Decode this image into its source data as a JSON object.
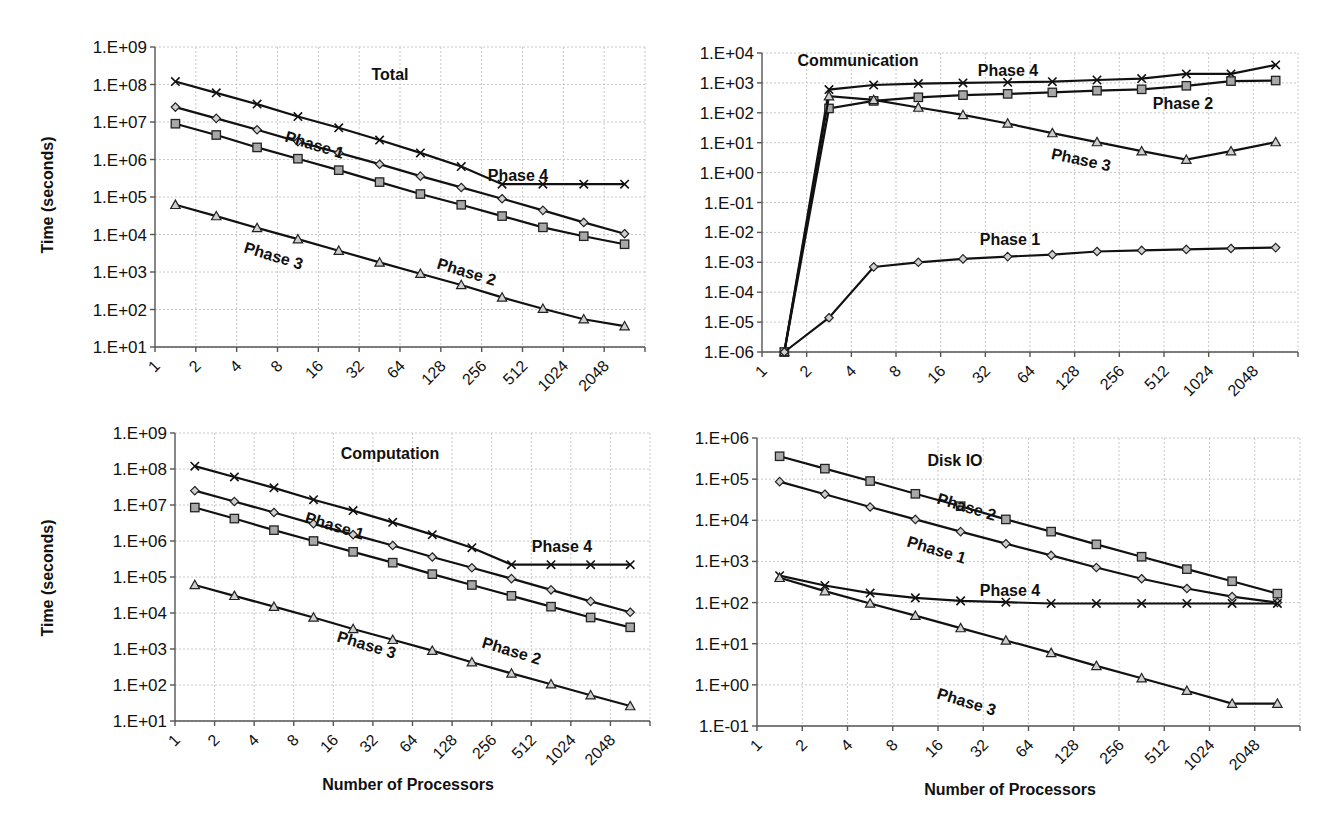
{
  "chart_data": [
    {
      "type": "line",
      "title": "Total",
      "xlabel": "",
      "ylabel": "Time (seconds)",
      "yscale": "log",
      "ylim": [
        10.0,
        1000000000.0
      ],
      "ytick_labels": [
        "1.E+01",
        "1.E+02",
        "1.E+03",
        "1.E+04",
        "1.E+05",
        "1.E+06",
        "1.E+07",
        "1.E+08",
        "1.E+09"
      ],
      "categories": [
        "1",
        "2",
        "4",
        "8",
        "16",
        "32",
        "64",
        "128",
        "256",
        "512",
        "1024",
        "2048"
      ],
      "grid": true,
      "legend": "inline labels",
      "series": [
        {
          "name": "Phase 4",
          "marker": "x",
          "values": [
            120000000.0,
            60000000.0,
            30000000.0,
            14000000.0,
            7000000.0,
            3300000.0,
            1500000.0,
            650000.0,
            220000.0,
            220000.0,
            220000.0,
            220000.0
          ]
        },
        {
          "name": "Phase 1",
          "marker": "diamond",
          "values": [
            25000000.0,
            12500000.0,
            6200000.0,
            3000000.0,
            1500000.0,
            750000.0,
            360000.0,
            180000.0,
            90000.0,
            44000.0,
            21000.0,
            10500.0
          ]
        },
        {
          "name": "Phase 2",
          "marker": "square",
          "values": [
            9000000.0,
            4500000.0,
            2100000.0,
            1050000.0,
            520000.0,
            250000.0,
            120000.0,
            62000.0,
            31000.0,
            15500.0,
            9000.0,
            5500.0
          ]
        },
        {
          "name": "Phase 3",
          "marker": "triangle",
          "values": [
            62000.0,
            31000.0,
            15000.0,
            7500.0,
            3700.0,
            1800.0,
            900.0,
            450.0,
            210.0,
            105.0,
            55.0,
            36.0
          ]
        }
      ]
    },
    {
      "type": "line",
      "title": "Communication",
      "xlabel": "",
      "ylabel": "",
      "yscale": "log",
      "ylim": [
        1e-06,
        10000.0
      ],
      "ytick_labels": [
        "1.E-06",
        "1.E-05",
        "1.E-04",
        "1.E-03",
        "1.E-02",
        "1.E-01",
        "1.E+00",
        "1.E+01",
        "1.E+02",
        "1.E+03",
        "1.E+04"
      ],
      "categories": [
        "1",
        "2",
        "4",
        "8",
        "16",
        "32",
        "64",
        "128",
        "256",
        "512",
        "1024",
        "2048"
      ],
      "grid": true,
      "legend": "inline labels",
      "series": [
        {
          "name": "Phase 4",
          "marker": "x",
          "values": [
            1e-06,
            600.0,
            850.0,
            950.0,
            1000.0,
            1050.0,
            1100.0,
            1250.0,
            1400.0,
            2000.0,
            2000.0,
            4000.0
          ]
        },
        {
          "name": "Phase 2",
          "marker": "square",
          "values": [
            1e-06,
            140.0,
            250.0,
            330.0,
            390.0,
            430.0,
            480.0,
            550.0,
            610.0,
            800.0,
            1150.0,
            1200.0
          ]
        },
        {
          "name": "Phase 3",
          "marker": "triangle",
          "values": [
            1e-06,
            360.0,
            270.0,
            150.0,
            85.0,
            44.0,
            21.0,
            10.5,
            5.2,
            2.7,
            5.2,
            10.5
          ]
        },
        {
          "name": "Phase 1",
          "marker": "diamond",
          "values": [
            1e-06,
            1.4e-05,
            0.0007,
            0.001,
            0.0013,
            0.00155,
            0.0018,
            0.0023,
            0.0025,
            0.0027,
            0.0029,
            0.0031
          ]
        }
      ]
    },
    {
      "type": "line",
      "title": "Computation",
      "xlabel": "Number of Processors",
      "ylabel": "Time (seconds)",
      "yscale": "log",
      "ylim": [
        10.0,
        1000000000.0
      ],
      "ytick_labels": [
        "1.E+01",
        "1.E+02",
        "1.E+03",
        "1.E+04",
        "1.E+05",
        "1.E+06",
        "1.E+07",
        "1.E+08",
        "1.E+09"
      ],
      "categories": [
        "1",
        "2",
        "4",
        "8",
        "16",
        "32",
        "64",
        "128",
        "256",
        "512",
        "1024",
        "2048"
      ],
      "grid": true,
      "legend": "inline labels",
      "series": [
        {
          "name": "Phase 4",
          "marker": "x",
          "values": [
            120000000.0,
            60000000.0,
            30000000.0,
            14000000.0,
            7000000.0,
            3300000.0,
            1500000.0,
            650000.0,
            220000.0,
            220000.0,
            220000.0,
            220000.0
          ]
        },
        {
          "name": "Phase 1",
          "marker": "diamond",
          "values": [
            25000000.0,
            12500000.0,
            6200000.0,
            3000000.0,
            1500000.0,
            750000.0,
            360000.0,
            180000.0,
            90000.0,
            44000.0,
            21000.0,
            10500.0
          ]
        },
        {
          "name": "Phase 2",
          "marker": "square",
          "values": [
            8500000.0,
            4200000.0,
            2000000.0,
            1000000.0,
            500000.0,
            250000.0,
            120000.0,
            60000.0,
            30000.0,
            15000.0,
            7500.0,
            4000.0
          ]
        },
        {
          "name": "Phase 3",
          "marker": "triangle",
          "values": [
            60000.0,
            30000.0,
            15000.0,
            7500.0,
            3600.0,
            1800.0,
            900.0,
            430.0,
            210.0,
            105.0,
            52.0,
            26.0
          ]
        }
      ]
    },
    {
      "type": "line",
      "title": "Disk IO",
      "xlabel": "Number of Processors",
      "ylabel": "",
      "yscale": "log",
      "ylim": [
        0.1,
        1000000.0
      ],
      "ytick_labels": [
        "1.E-01",
        "1.E+00",
        "1.E+01",
        "1.E+02",
        "1.E+03",
        "1.E+04",
        "1.E+05",
        "1.E+06"
      ],
      "categories": [
        "1",
        "2",
        "4",
        "8",
        "16",
        "32",
        "64",
        "128",
        "256",
        "512",
        "1024",
        "2048"
      ],
      "grid": true,
      "legend": "inline labels",
      "series": [
        {
          "name": "Phase 2",
          "marker": "square",
          "values": [
            360000.0,
            180000.0,
            90000.0,
            44000.0,
            22000.0,
            10500.0,
            5300.0,
            2600.0,
            1300.0,
            650.0,
            330.0,
            165.0
          ]
        },
        {
          "name": "Phase 1",
          "marker": "diamond",
          "values": [
            87000.0,
            43000.0,
            21000.0,
            10500.0,
            5300.0,
            2700.0,
            1400.0,
            710.0,
            380.0,
            220.0,
            140.0,
            100.0
          ]
        },
        {
          "name": "Phase 4",
          "marker": "x",
          "values": [
            450.0,
            260.0,
            170.0,
            130.0,
            110.0,
            102.0,
            95.0,
            95.0,
            95.0,
            95.0,
            95.0,
            95.0
          ]
        },
        {
          "name": "Phase 3",
          "marker": "triangle",
          "values": [
            400.0,
            190.0,
            95.0,
            48.0,
            24.0,
            12.0,
            6,
            2.9,
            1.45,
            0.72,
            0.35,
            0.35
          ]
        }
      ]
    }
  ],
  "layout": [
    {
      "plot": {
        "left": 155,
        "top": 47,
        "right": 645,
        "bottom": 347
      },
      "title_pos": [
        390,
        80
      ],
      "ylabel_pos": [
        53,
        195
      ],
      "xlabel_pos": null,
      "series_labels": [
        {
          "text": "Phase 4",
          "x": 518,
          "y": 181,
          "rot": 0
        },
        {
          "text": "Phase 1",
          "x": 313,
          "y": 150,
          "rot": 17
        },
        {
          "text": "Phase 2",
          "x": 465,
          "y": 277,
          "rot": 17
        },
        {
          "text": "Phase 3",
          "x": 272,
          "y": 261,
          "rot": 17
        }
      ]
    },
    {
      "plot": {
        "left": 762,
        "top": 53,
        "right": 1298,
        "bottom": 352
      },
      "title_pos": [
        858,
        66
      ],
      "ylabel_pos": null,
      "xlabel_pos": null,
      "series_labels": [
        {
          "text": "Phase 4",
          "x": 1008,
          "y": 76,
          "rot": 0
        },
        {
          "text": "Phase 2",
          "x": 1183,
          "y": 109,
          "rot": 0
        },
        {
          "text": "Phase 3",
          "x": 1080,
          "y": 165,
          "rot": 12
        },
        {
          "text": "Phase 1",
          "x": 1010,
          "y": 245,
          "rot": 0
        }
      ]
    },
    {
      "plot": {
        "left": 175,
        "top": 433,
        "right": 650,
        "bottom": 721
      },
      "title_pos": [
        390,
        459
      ],
      "ylabel_pos": [
        53,
        578
      ],
      "xlabel_pos": [
        408,
        790
      ],
      "series_labels": [
        {
          "text": "Phase 4",
          "x": 562,
          "y": 552,
          "rot": 0
        },
        {
          "text": "Phase 1",
          "x": 333,
          "y": 531,
          "rot": 17
        },
        {
          "text": "Phase 2",
          "x": 510,
          "y": 656,
          "rot": 17
        },
        {
          "text": "Phase 3",
          "x": 365,
          "y": 650,
          "rot": 17
        }
      ]
    },
    {
      "plot": {
        "left": 757,
        "top": 438,
        "right": 1300,
        "bottom": 726
      },
      "title_pos": [
        955,
        466
      ],
      "ylabel_pos": null,
      "xlabel_pos": [
        1010,
        795
      ],
      "series_labels": [
        {
          "text": "Phase 2",
          "x": 965,
          "y": 512,
          "rot": 17
        },
        {
          "text": "Phase 1",
          "x": 935,
          "y": 555,
          "rot": 17
        },
        {
          "text": "Phase 4",
          "x": 1010,
          "y": 596,
          "rot": 0
        },
        {
          "text": "Phase 3",
          "x": 965,
          "y": 707,
          "rot": 17
        }
      ]
    }
  ]
}
